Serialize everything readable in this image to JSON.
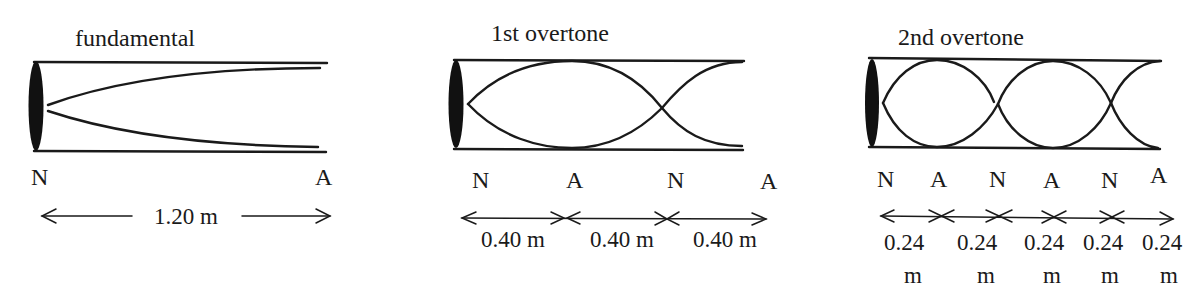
{
  "diagram": {
    "type": "standing waves in a closed pipe",
    "panels": [
      {
        "title": "fundamental",
        "labels": [
          "N",
          "A"
        ],
        "dimensions": [
          "1.20 m"
        ]
      },
      {
        "title": "1st overtone",
        "labels": [
          "N",
          "A",
          "N",
          "A"
        ],
        "dimensions": [
          "0.40 m",
          "0.40 m",
          "0.40 m"
        ]
      },
      {
        "title": "2nd overtone",
        "labels": [
          "N",
          "A",
          "N",
          "A",
          "N",
          "A"
        ],
        "dimensions": [
          {
            "value": "0.24",
            "unit": "m"
          },
          {
            "value": "0.24",
            "unit": "m"
          },
          {
            "value": "0.24",
            "unit": "m"
          },
          {
            "value": "0.24",
            "unit": "m"
          },
          {
            "value": "0.24",
            "unit": "m"
          }
        ]
      }
    ]
  }
}
